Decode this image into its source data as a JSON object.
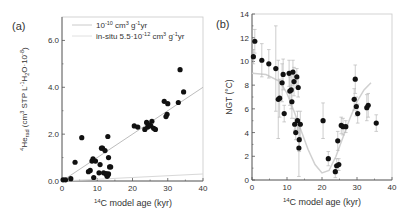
{
  "chart_data": [
    {
      "panel": "(a)",
      "type": "scatter",
      "title": "",
      "xlabel": "14C model age (kyr)",
      "xlabel_sup": "14",
      "xlabel_main": "C model age (kyr)",
      "ylabel": "4He_rad (cm3 STP L-1 H2O 10-8)",
      "ylabel_parts": {
        "sup1": "4",
        "base": "He",
        "sub": "rad",
        "rest": " (cm",
        "sup2": "3",
        "rest2": " STP L",
        "sup3": "-1",
        "rest3": "H",
        "sub2": "2",
        "rest4": "O·10",
        "sup4": "-8",
        "end": ")"
      },
      "xlim": [
        0,
        40
      ],
      "ylim": [
        0,
        7
      ],
      "xticks": [
        0,
        10,
        20,
        30,
        40
      ],
      "yticks": [
        0.0,
        2.0,
        4.0,
        6.0
      ],
      "ytick_labels": [
        "0.0",
        "2.0",
        "4.0",
        "6.0"
      ],
      "grid": false,
      "legend_position": "upper left",
      "legend": [
        {
          "label": "10^-10 cm3 g-1 yr",
          "base": "10",
          "sup": "-10",
          "unit": " cm",
          "sup2": "3",
          "unit2": " g",
          "sup3": "-1",
          "unit3": "yr",
          "color": "#bdbdbd"
        },
        {
          "label": "in-situ 5.5·10^-12 cm3 g-1 yr",
          "base": "in-situ 5.5·10",
          "sup": "-12",
          "unit": " cm",
          "sup2": "3",
          "unit2": " g",
          "sup3": "-1",
          "unit3": "yr",
          "color": "#d8d8d8"
        }
      ],
      "lines": [
        {
          "name": "10^-10 cm3 g-1 yr",
          "x": [
            0,
            40
          ],
          "y": [
            0.0,
            4.0
          ],
          "color": "#bdbdbd"
        },
        {
          "name": "in-situ 5.5·10^-12 cm3 g-1 yr",
          "x": [
            0,
            40
          ],
          "y": [
            0.0,
            0.3
          ],
          "color": "#d8d8d8"
        }
      ],
      "series": [
        {
          "name": "4He_rad samples",
          "color": "#111111",
          "x": [
            0.3,
            1.0,
            2.5,
            3.7,
            5.6,
            7.5,
            8.0,
            8.5,
            8.8,
            9.0,
            9.5,
            10.5,
            10.8,
            11.2,
            11.5,
            11.8,
            12.2,
            12.5,
            12.8,
            13.0,
            13.2,
            13.5,
            13.2,
            13.0,
            12.6,
            13.8,
            20.5,
            21.5,
            23.5,
            24.0,
            24.3,
            24.8,
            25.2,
            25.5,
            26.0,
            26.5,
            29.5,
            29.8,
            30.0,
            33.0,
            33.5,
            34.5,
            29.0
          ],
          "y": [
            0.05,
            0.05,
            0.1,
            0.8,
            1.85,
            0.4,
            0.45,
            0.85,
            0.95,
            0.15,
            0.85,
            0.35,
            0.7,
            1.4,
            1.4,
            0.35,
            1.3,
            0.3,
            0.2,
            1.9,
            1.0,
            0.6,
            0.3,
            0.25,
            0.3,
            0.6,
            2.35,
            2.3,
            2.2,
            2.5,
            2.3,
            2.4,
            2.35,
            2.55,
            2.25,
            2.2,
            2.75,
            2.85,
            3.3,
            3.35,
            4.75,
            3.8,
            3.4
          ]
        }
      ]
    },
    {
      "panel": "(b)",
      "type": "scatter",
      "title": "",
      "xlabel": "14C model age (kyr)",
      "xlabel_sup": "14",
      "xlabel_main": "C model age (kyr)",
      "ylabel": "NGT (°C)",
      "xlim": [
        0,
        40
      ],
      "ylim": [
        0,
        14
      ],
      "xticks": [
        0,
        10,
        20,
        30,
        40
      ],
      "yticks": [
        0,
        2,
        4,
        6,
        8,
        10,
        12,
        14
      ],
      "grid": false,
      "error_bars": true,
      "trend_curve": {
        "color": "#d0d0d0",
        "x": [
          0,
          4,
          8,
          10,
          12,
          14,
          16,
          18,
          20,
          22,
          24,
          26,
          28,
          30,
          32,
          34
        ],
        "y": [
          9.0,
          8.9,
          8.3,
          7.3,
          5.8,
          4.2,
          2.6,
          1.3,
          0.6,
          0.8,
          2.0,
          3.6,
          5.2,
          6.6,
          7.6,
          8.2
        ]
      },
      "series": [
        {
          "name": "NGT samples",
          "color": "#111111",
          "x": [
            0.4,
            0.8,
            2.8,
            4.8,
            6.8,
            7.5,
            7.9,
            8.6,
            8.9,
            9.2,
            10.6,
            10.8,
            11.2,
            11.4,
            11.7,
            12.0,
            12.2,
            12.5,
            12.8,
            13.2,
            13.4,
            13.0,
            13.5,
            13.8,
            20.3,
            21.8,
            23.8,
            24.2,
            24.5,
            24.8,
            25.5,
            26.0,
            26.8,
            29.2,
            29.5,
            29.8,
            30.2,
            32.8,
            33.2,
            35.5
          ],
          "y": [
            10.4,
            11.7,
            10.1,
            9.8,
            9.4,
            6.8,
            6.9,
            8.2,
            8.9,
            5.6,
            9.0,
            7.5,
            7.6,
            6.6,
            9.1,
            8.3,
            4.7,
            4.0,
            8.7,
            7.8,
            2.7,
            5.0,
            3.4,
            4.7,
            5.0,
            1.8,
            0.7,
            1.2,
            3.3,
            1.3,
            4.6,
            4.5,
            4.5,
            6.8,
            8.5,
            6.2,
            5.6,
            6.1,
            6.3,
            4.8
          ],
          "err": [
            0.6,
            1.0,
            1.4,
            1.2,
            3.6,
            3.3,
            1.6,
            1.6,
            1.3,
            0.7,
            1.1,
            1.2,
            1.6,
            1.4,
            1.0,
            1.2,
            0.5,
            0.6,
            0.7,
            0.8,
            2.4,
            0.8,
            1.0,
            1.1,
            1.5,
            0.6,
            0.5,
            0.6,
            0.8,
            0.5,
            0.7,
            0.7,
            0.5,
            0.9,
            1.2,
            0.8,
            0.8,
            1.1,
            1.0,
            0.7
          ]
        }
      ]
    }
  ]
}
